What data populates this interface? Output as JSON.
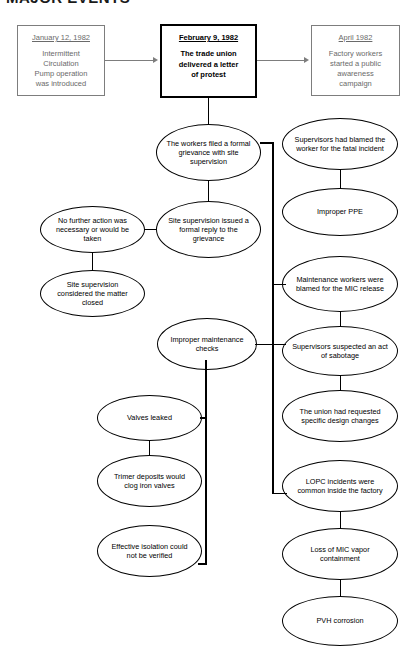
{
  "page": {
    "header_clipped": "MAJOR EVENTS"
  },
  "timeline": [
    {
      "id": "jan-1982",
      "date": "January 12, 1982",
      "body": "Intermittent\nCirculation\nPump operation\nwas introduced",
      "emphasis": "side"
    },
    {
      "id": "feb-1982",
      "date": "February 9, 1982",
      "body": "The trade union\ndelivered a letter\nof protest",
      "emphasis": "main"
    },
    {
      "id": "apr-1982",
      "date": "April 1982",
      "body": "Factory workers\nstarted a public\nawareness\ncampaign",
      "emphasis": "side"
    }
  ],
  "nodes": {
    "workers_filed": "The workers filed a formal grievance with site supervision",
    "site_reply": "Site supervision issued a formal reply to the grievance",
    "no_further_action": "No further action was necessary or would be taken",
    "matter_closed": "Site supervision considered the matter closed",
    "improper_maintenance": "Improper maintenance checks",
    "valves_leaked": "Valves leaked",
    "trimer_deposits": "Trimer deposits would clog iron valves",
    "effective_isolation": "Effective isolation could not be verified",
    "supervisors_blamed": "Supervisors had blamed the worker for the fatal incident",
    "improper_ppe": "Improper PPE",
    "maintenance_blamed": "Maintenance workers were blamed for the MIC release",
    "sabotage": "Supervisors suspected an act of sabotage",
    "design_changes": "The union had requested specific design changes",
    "lopc": "LOPC incidents were common inside the factory",
    "mic_vapor": "Loss of MIC vapor containment",
    "pvh": "PVH corrosion"
  },
  "colors": {
    "node_stroke": "#000000",
    "side_box_stroke": "#7d7d7d",
    "side_box_text": "#6a6a6a",
    "main_box_stroke": "#000000",
    "background": "#ffffff"
  }
}
